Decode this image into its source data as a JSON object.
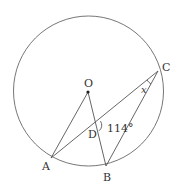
{
  "figure": {
    "type": "circle-geometry",
    "circle": {
      "center_label": "O",
      "cx": 88.5,
      "cy": 91,
      "r": 75
    },
    "points": {
      "O": {
        "label": "O",
        "x": 88,
        "y": 92
      },
      "A": {
        "label": "A",
        "x": 51,
        "y": 158
      },
      "B": {
        "label": "B",
        "x": 106,
        "y": 166
      },
      "C": {
        "label": "C",
        "x": 158,
        "y": 71
      },
      "D": {
        "label": "D",
        "x": 97,
        "y": 124
      }
    },
    "segments": [
      "OA",
      "OB",
      "AC",
      "BC"
    ],
    "angles": {
      "BDC": {
        "label": "114°",
        "value_deg": 114
      },
      "ACB": {
        "label": "x"
      }
    },
    "colors": {
      "stroke": "#555555",
      "text": "#333333"
    }
  }
}
